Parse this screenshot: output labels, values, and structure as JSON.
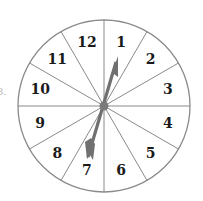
{
  "figure": {
    "label_fragment": "3.",
    "spinner": {
      "center": [
        104,
        106
      ],
      "radius": 86,
      "line_color": "#8a8a8a",
      "arrow_color": "#707070",
      "sections": [
        {
          "label": "1",
          "angle": 15
        },
        {
          "label": "2",
          "angle": 45
        },
        {
          "label": "3",
          "angle": 75
        },
        {
          "label": "4",
          "angle": 105
        },
        {
          "label": "5",
          "angle": 135
        },
        {
          "label": "6",
          "angle": 165
        },
        {
          "label": "7",
          "angle": 195
        },
        {
          "label": "8",
          "angle": 225
        },
        {
          "label": "9",
          "angle": 255
        },
        {
          "label": "10",
          "angle": 285
        },
        {
          "label": "11",
          "angle": 315
        },
        {
          "label": "12",
          "angle": 345
        }
      ],
      "arrow": {
        "tip": [
          118,
          57
        ],
        "tail": [
          88,
          157
        ]
      }
    }
  }
}
